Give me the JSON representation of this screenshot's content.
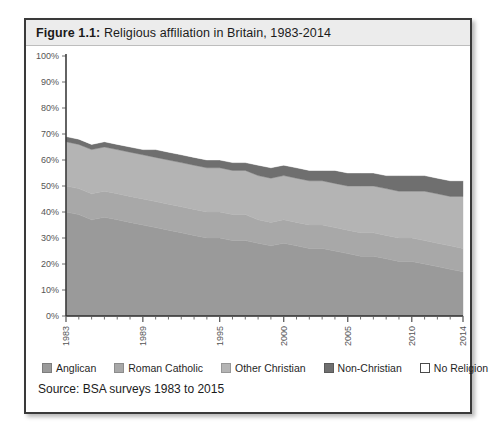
{
  "figure": {
    "label": "Figure 1.1:",
    "caption": "Religious affiliation in Britain, 1983-2014",
    "title_full": "Figure 1.1: Religious affiliation in Britain, 1983-2014",
    "source": "Source: BSA surveys 1983 to 2015"
  },
  "legend": {
    "items": [
      {
        "label": "Anglican",
        "color": "#9a9a9a",
        "outline": "#7d7d7d"
      },
      {
        "label": "Roman Catholic",
        "color": "#a8a8a8",
        "outline": "#8c8c8c"
      },
      {
        "label": "Other Christian",
        "color": "#b4b4b4",
        "outline": "#979797"
      },
      {
        "label": "Non-Christian",
        "color": "#6f6f6f",
        "outline": "#5a5a5a"
      },
      {
        "label": "No Religion",
        "color": "#ffffff",
        "outline": "#4a4a4a"
      }
    ]
  },
  "chart_data": {
    "type": "area",
    "stacked": true,
    "title": "Religious affiliation in Britain, 1983-2014",
    "xlabel": "",
    "ylabel": "",
    "ylim": [
      0,
      100
    ],
    "yticks": [
      "0%",
      "10%",
      "20%",
      "30%",
      "40%",
      "50%",
      "60%",
      "70%",
      "80%",
      "90%",
      "100%"
    ],
    "ytick_values": [
      0,
      10,
      20,
      30,
      40,
      50,
      60,
      70,
      80,
      90,
      100
    ],
    "grid": false,
    "legend_position": "bottom",
    "x": [
      1983,
      1984,
      1985,
      1986,
      1987,
      1988,
      1989,
      1990,
      1991,
      1992,
      1993,
      1994,
      1995,
      1996,
      1997,
      1998,
      1999,
      2000,
      2001,
      2002,
      2003,
      2004,
      2005,
      2006,
      2007,
      2008,
      2009,
      2010,
      2011,
      2012,
      2013,
      2014
    ],
    "xtick_labels": [
      "1983",
      "1989",
      "1995",
      "2000",
      "2005",
      "2010",
      "2014"
    ],
    "xtick_values": [
      1983,
      1989,
      1995,
      2000,
      2005,
      2010,
      2014
    ],
    "series": [
      {
        "name": "Anglican",
        "values": [
          40,
          39,
          37,
          38,
          37,
          36,
          35,
          34,
          33,
          32,
          31,
          30,
          30,
          29,
          29,
          28,
          27,
          28,
          27,
          26,
          26,
          25,
          24,
          23,
          23,
          22,
          21,
          21,
          20,
          19,
          18,
          17
        ]
      },
      {
        "name": "Roman Catholic",
        "values": [
          10,
          10,
          10,
          10,
          10,
          10,
          10,
          10,
          10,
          10,
          10,
          10,
          10,
          10,
          10,
          9,
          9,
          9,
          9,
          9,
          9,
          9,
          9,
          9,
          9,
          9,
          9,
          9,
          9,
          9,
          9,
          9
        ]
      },
      {
        "name": "Other Christian",
        "values": [
          17,
          17,
          17,
          17,
          17,
          17,
          17,
          17,
          17,
          17,
          17,
          17,
          17,
          17,
          17,
          17,
          17,
          17,
          17,
          17,
          17,
          17,
          17,
          18,
          18,
          18,
          18,
          18,
          19,
          19,
          19,
          20
        ]
      },
      {
        "name": "Non-Christian",
        "values": [
          2,
          2,
          2,
          2,
          2,
          2,
          2,
          3,
          3,
          3,
          3,
          3,
          3,
          3,
          3,
          4,
          4,
          4,
          4,
          4,
          4,
          5,
          5,
          5,
          5,
          5,
          6,
          6,
          6,
          6,
          6,
          6
        ]
      },
      {
        "name": "No Religion",
        "values": [
          31,
          32,
          34,
          33,
          34,
          35,
          36,
          36,
          37,
          38,
          39,
          40,
          40,
          41,
          41,
          42,
          43,
          42,
          43,
          44,
          44,
          44,
          45,
          45,
          45,
          46,
          46,
          46,
          46,
          47,
          48,
          48
        ]
      }
    ]
  }
}
